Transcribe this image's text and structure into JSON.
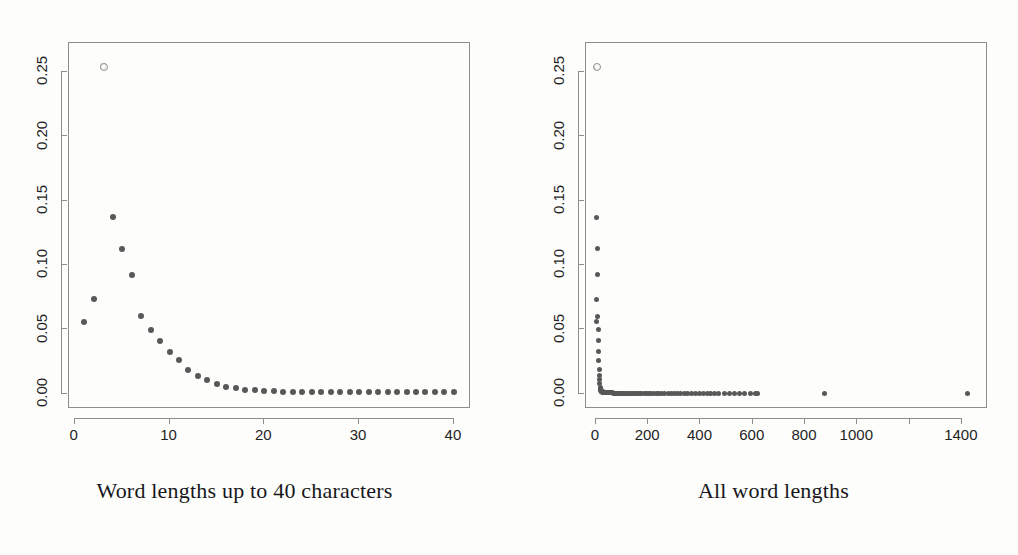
{
  "figure": {
    "background_color": "#fdfdfc",
    "marker_color": "#585858",
    "frame_color": "#8d8d8d",
    "text_color": "#1f1f1f"
  },
  "panels": [
    {
      "id": "left",
      "caption": "Word lengths up to 40 characters",
      "x_ticks": [
        {
          "value": 0,
          "label": "0"
        },
        {
          "value": 10,
          "label": "10"
        },
        {
          "value": 20,
          "label": "20"
        },
        {
          "value": 30,
          "label": "30"
        },
        {
          "value": 40,
          "label": "40"
        }
      ],
      "y_ticks": [
        {
          "value": 0.0,
          "label": "0.00"
        },
        {
          "value": 0.05,
          "label": "0.05"
        },
        {
          "value": 0.1,
          "label": "0.10"
        },
        {
          "value": 0.15,
          "label": "0.15"
        },
        {
          "value": 0.2,
          "label": "0.20"
        },
        {
          "value": 0.25,
          "label": "0.25"
        }
      ]
    },
    {
      "id": "right",
      "caption": "All word lengths",
      "x_ticks": [
        {
          "value": 0,
          "label": "0"
        },
        {
          "value": 200,
          "label": "200"
        },
        {
          "value": 400,
          "label": "400"
        },
        {
          "value": 600,
          "label": "600"
        },
        {
          "value": 800,
          "label": "800"
        },
        {
          "value": 1000,
          "label": "1000"
        },
        {
          "value": 1200,
          "label": ""
        },
        {
          "value": 1400,
          "label": "1400"
        }
      ],
      "y_ticks": [
        {
          "value": 0.0,
          "label": "0.00"
        },
        {
          "value": 0.05,
          "label": "0.05"
        },
        {
          "value": 0.1,
          "label": "0.10"
        },
        {
          "value": 0.15,
          "label": "0.15"
        },
        {
          "value": 0.2,
          "label": "0.20"
        },
        {
          "value": 0.25,
          "label": "0.25"
        }
      ]
    }
  ],
  "chart_data": [
    {
      "type": "scatter",
      "title": "Word lengths up to 40 characters",
      "xlabel": "",
      "ylabel": "",
      "xlim": [
        -0.6,
        41.8
      ],
      "ylim": [
        -0.012,
        0.2725
      ],
      "grid": false,
      "legend": false,
      "marker": "filled-circle",
      "highlight_point": {
        "x": 3,
        "y": 0.2545,
        "marker": "open-circle"
      },
      "x": [
        1,
        2,
        3,
        4,
        5,
        6,
        7,
        8,
        9,
        10,
        11,
        12,
        13,
        14,
        15,
        16,
        17,
        18,
        19,
        20,
        21,
        22,
        23,
        24,
        25,
        26,
        27,
        28,
        29,
        30,
        31,
        32,
        33,
        34,
        35,
        36,
        37,
        38,
        39,
        40
      ],
      "y": [
        0.056,
        0.0735,
        0.2545,
        0.1372,
        0.1125,
        0.0922,
        0.06,
        0.0497,
        0.0412,
        0.0325,
        0.0258,
        0.0185,
        0.0137,
        0.0108,
        0.0075,
        0.005,
        0.004,
        0.003,
        0.0024,
        0.002,
        0.0017,
        0.0016,
        0.0015,
        0.0014,
        0.0013,
        0.0013,
        0.0012,
        0.0012,
        0.0011,
        0.0011,
        0.0011,
        0.001,
        0.001,
        0.001,
        0.001,
        0.0009,
        0.0009,
        0.0009,
        0.0009,
        0.0009
      ]
    },
    {
      "type": "scatter",
      "title": "All word lengths",
      "xlabel": "",
      "ylabel": "",
      "xlim": [
        -38,
        1500
      ],
      "ylim": [
        -0.012,
        0.2725
      ],
      "grid": false,
      "legend": false,
      "marker": "filled-circle",
      "highlight_point": {
        "x": 3,
        "y": 0.2545,
        "marker": "open-circle"
      },
      "x": [
        1,
        2,
        3,
        4,
        5,
        6,
        7,
        8,
        9,
        10,
        11,
        12,
        13,
        14,
        15,
        16,
        17,
        18,
        19,
        20,
        21,
        22,
        23,
        24,
        25,
        26,
        27,
        28,
        29,
        30,
        31,
        32,
        33,
        34,
        35,
        36,
        37,
        38,
        39,
        40,
        42,
        44,
        46,
        48,
        50,
        52,
        55,
        58,
        60,
        63,
        66,
        70,
        74,
        78,
        82,
        86,
        90,
        95,
        100,
        105,
        110,
        116,
        122,
        128,
        134,
        140,
        147,
        154,
        161,
        168,
        176,
        184,
        192,
        200,
        210,
        220,
        230,
        240,
        252,
        264,
        276,
        288,
        300,
        312,
        325,
        338,
        352,
        366,
        380,
        395,
        410,
        425,
        440,
        455,
        470,
        490,
        510,
        530,
        550,
        570,
        590,
        610,
        620,
        875,
        1420
      ],
      "y": [
        0.056,
        0.0735,
        0.2545,
        0.1372,
        0.1125,
        0.0922,
        0.06,
        0.0497,
        0.0412,
        0.0325,
        0.0258,
        0.0185,
        0.0137,
        0.0108,
        0.0075,
        0.005,
        0.004,
        0.003,
        0.0024,
        0.002,
        0.0017,
        0.0016,
        0.0015,
        0.0014,
        0.0013,
        0.0013,
        0.0012,
        0.0012,
        0.0011,
        0.0011,
        0.0011,
        0.001,
        0.001,
        0.001,
        0.001,
        0.0009,
        0.0009,
        0.0009,
        0.0009,
        0.0009,
        0.0008,
        0.0008,
        0.0007,
        0.0007,
        0.0006,
        0.0006,
        0.0006,
        0.0005,
        0.0005,
        0.0005,
        0.0004,
        0.0004,
        0.0004,
        0.0004,
        0.0003,
        0.0003,
        0.0003,
        0.0003,
        0.0003,
        0.0002,
        0.0002,
        0.0002,
        0.0002,
        0.0002,
        0.0002,
        0.0002,
        0.0002,
        0.0002,
        0.0001,
        0.0001,
        0.0001,
        0.0001,
        0.0001,
        0.0001,
        0.0001,
        0.0001,
        0.0001,
        0.0001,
        0.0001,
        0.0001,
        0.0001,
        0.0001,
        0.0001,
        0.0001,
        0.0001,
        0.0001,
        0.0001,
        0.0001,
        0.0001,
        0.0001,
        0.0001,
        0.0001,
        0.0001,
        0.0001,
        0.0001,
        0.0001,
        0.0001,
        0.0001,
        0.0001,
        0.0001,
        0.0001,
        0.0001,
        0.0001,
        0.0001,
        0.0001,
        0.0001
      ]
    }
  ]
}
